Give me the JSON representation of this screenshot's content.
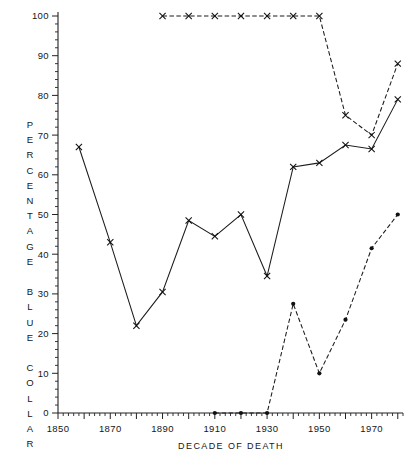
{
  "chart_data": {
    "type": "line",
    "title": "",
    "xlabel": "DECADE OF DEATH",
    "ylabel": "PERCENTAGE BLUE COLLAR",
    "xlim": [
      1850,
      1982
    ],
    "ylim": [
      0,
      100
    ],
    "grid": false,
    "legend": "none",
    "x_ticklabels": [
      "1850",
      "1870",
      "1890",
      "1910",
      "1930",
      "1950",
      "1970"
    ],
    "x_ticklabel_values": [
      1850,
      1870,
      1890,
      1910,
      1930,
      1950,
      1970
    ],
    "x_major_ticks": [
      1850,
      1860,
      1870,
      1880,
      1890,
      1900,
      1910,
      1920,
      1930,
      1940,
      1950,
      1960,
      1970,
      1980
    ],
    "x_minor_tick_step": 2,
    "y_ticklabels": [
      "0",
      "10",
      "20",
      "30",
      "40",
      "50",
      "60",
      "70",
      "80",
      "90",
      "100"
    ],
    "y_ticklabel_values": [
      0,
      10,
      20,
      30,
      40,
      50,
      60,
      70,
      80,
      90,
      100
    ],
    "y_minor_tick_step": 2,
    "series": [
      {
        "name": "upper-series",
        "line_style": "dashed",
        "marker": "x",
        "x": [
          1890,
          1900,
          1910,
          1920,
          1930,
          1940,
          1950,
          1960,
          1970,
          1980
        ],
        "values": [
          100,
          100,
          100,
          100,
          100,
          100,
          100,
          75,
          70,
          88
        ]
      },
      {
        "name": "middle-series",
        "line_style": "solid",
        "marker": "x",
        "x": [
          1858,
          1870,
          1880,
          1890,
          1900,
          1910,
          1920,
          1930,
          1940,
          1950,
          1960,
          1970,
          1980
        ],
        "values": [
          67,
          43,
          22,
          30.5,
          48.5,
          44.5,
          50,
          34.5,
          62,
          63,
          67.5,
          66.5,
          79
        ]
      },
      {
        "name": "lower-series",
        "line_style": "dashed",
        "marker": "dot",
        "x": [
          1910,
          1920,
          1930,
          1940,
          1950,
          1960,
          1970,
          1980
        ],
        "values": [
          0,
          0,
          0,
          27.5,
          10,
          23.5,
          41.5,
          50
        ]
      }
    ]
  }
}
